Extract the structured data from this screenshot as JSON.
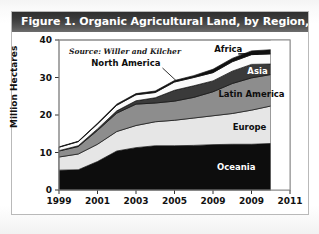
{
  "figure": {
    "title": "Figure 1. Organic Agricultural Land, by Region, 1999–2010",
    "source_note": "Source: Willer and Kilcher"
  },
  "chart_data": {
    "type": "area",
    "title": "Figure 1. Organic Agricultural Land, by Region, 1999–2010",
    "subtitle": "Source: Willer and Kilcher",
    "xlabel": "",
    "ylabel": "Million Hectares",
    "ylim": [
      0,
      40
    ],
    "xlim": [
      1999,
      2011
    ],
    "ytick_labels": [
      "0",
      "10",
      "20",
      "30",
      "40"
    ],
    "ytick_values": [
      0,
      10,
      20,
      30,
      40
    ],
    "xtick_labels": [
      "1999",
      "2001",
      "2003",
      "2005",
      "2009",
      "2009",
      "2011"
    ],
    "xtick_values": [
      1999,
      2001,
      2003,
      2005,
      2007,
      2009,
      2011
    ],
    "grid": false,
    "legend": "inline-annotations",
    "stacked": true,
    "stack_order_bottom_to_top": [
      "Oceania",
      "Europe",
      "Latin America",
      "Asia",
      "North America",
      "Africa"
    ],
    "x": [
      1999,
      2000,
      2001,
      2002,
      2003,
      2004,
      2005,
      2006,
      2007,
      2008,
      2009,
      2010
    ],
    "series": [
      {
        "name": "Oceania",
        "color": "#0d0d0d",
        "label_color": "#ffffff",
        "values": [
          5.3,
          5.4,
          7.6,
          10.4,
          11.3,
          11.8,
          11.8,
          11.9,
          12.1,
          12.2,
          12.2,
          12.4
        ]
      },
      {
        "name": "Europe",
        "color": "#e6e6e6",
        "label_color": "#0d0d0d",
        "values": [
          3.5,
          4.2,
          4.6,
          5.2,
          5.9,
          6.4,
          6.8,
          7.3,
          7.7,
          8.2,
          9.1,
          10.0
        ]
      },
      {
        "name": "Latin America",
        "color": "#8d8d8d",
        "label_color": "#0d0d0d",
        "values": [
          1.6,
          2.0,
          3.7,
          4.9,
          5.7,
          5.0,
          5.1,
          5.5,
          6.4,
          8.0,
          8.6,
          8.4
        ]
      },
      {
        "name": "Asia",
        "color": "#3a3a3a",
        "label_color": "#ffffff",
        "values": [
          0.1,
          0.2,
          0.4,
          0.6,
          0.9,
          1.4,
          2.9,
          3.1,
          2.9,
          3.3,
          3.6,
          2.8
        ]
      },
      {
        "name": "North America",
        "color": "#fbfbfb",
        "label_color": "#0d0d0d",
        "values": [
          0.9,
          1.1,
          1.3,
          1.5,
          1.6,
          1.4,
          2.2,
          2.2,
          2.2,
          2.5,
          2.6,
          2.7
        ]
      },
      {
        "name": "Africa",
        "color": "#101010",
        "label_color": "#0d0d0d",
        "values": [
          0.1,
          0.1,
          0.2,
          0.3,
          0.3,
          0.4,
          0.4,
          0.5,
          0.9,
          0.9,
          1.0,
          1.1
        ]
      }
    ],
    "annotations": [
      {
        "text": "Africa",
        "series": "Africa"
      },
      {
        "text": "North America",
        "series": "North America"
      },
      {
        "text": "Asia",
        "series": "Asia"
      },
      {
        "text": "Latin America",
        "series": "Latin America"
      },
      {
        "text": "Europe",
        "series": "Europe"
      },
      {
        "text": "Oceania",
        "series": "Oceania"
      }
    ]
  }
}
